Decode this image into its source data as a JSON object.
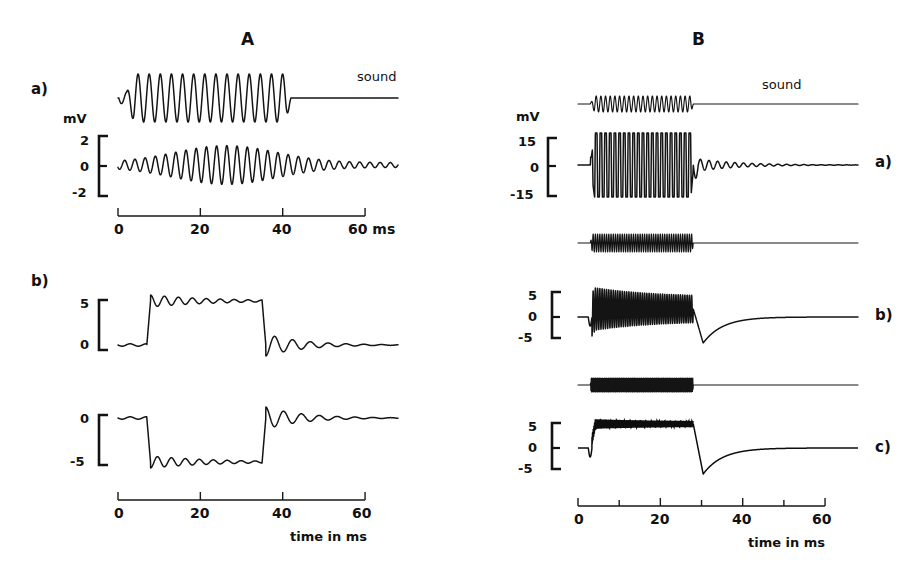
{
  "figure": {
    "background": "#ffffff",
    "ink": "#141414",
    "width": 924,
    "height": 570
  },
  "panels": [
    {
      "id": "A",
      "title": "A",
      "axis": {
        "title": "time in ms",
        "unit_label": "mV",
        "ticks_major": [
          0,
          20,
          40,
          60
        ],
        "tick_labels": [
          "0",
          "20",
          "40",
          "60"
        ],
        "minor_step": null,
        "range_ms": [
          0,
          68
        ]
      },
      "rows": [
        {
          "part": "a)",
          "sound_label": "sound",
          "scale": {
            "top": "2",
            "mid": "0",
            "bottom": "-2",
            "unit": "mV"
          },
          "axis_suffix": "60 ms"
        },
        {
          "part": "b)",
          "sound_label": "",
          "scales": [
            {
              "top": "5",
              "bottom": "0"
            },
            {
              "top": "0",
              "bottom": "-5"
            }
          ]
        }
      ]
    },
    {
      "id": "B",
      "title": "B",
      "axis": {
        "title": "time in ms",
        "unit_label": "mV",
        "ticks_major": [
          0,
          20,
          40,
          60
        ],
        "tick_labels": [
          "0",
          "20",
          "40",
          "60"
        ],
        "minor_step": 10,
        "range_ms": [
          0,
          68
        ]
      },
      "rows": [
        {
          "part": "a)",
          "sound_label": "sound",
          "scale": {
            "top": "15",
            "mid": "0",
            "bottom": "-15"
          }
        },
        {
          "part": "b)",
          "sound_label": "",
          "scale": {
            "top": "5",
            "mid": "0",
            "bottom": "-5"
          }
        },
        {
          "part": "c)",
          "sound_label": "",
          "scale": {
            "top": "5",
            "mid": "0",
            "bottom": "-5"
          }
        }
      ]
    }
  ],
  "chart_data": {
    "type": "line",
    "xlabel": "time in ms",
    "ylabel": "mV",
    "panels": [
      {
        "panel": "A",
        "x0_px": 118,
        "x1_px": 398,
        "xlim_ms": [
          0,
          68
        ],
        "traces": [
          {
            "name": "A-a-sound",
            "kind": "stimulus",
            "label": "sound",
            "baseline_y": 98,
            "start_ms": 1.5,
            "stop_ms": 42,
            "cycles": 15,
            "amplitude_px": 24,
            "onset_dip_px": 7,
            "style": "sine-burst",
            "tail_flat": true
          },
          {
            "name": "A-a-response",
            "kind": "response",
            "baseline_y": 165,
            "start_ms": 1.0,
            "stop_ms": 68,
            "cycles": 27,
            "amplitude_px": 20,
            "envelope": "spindle",
            "style": "sine-envelope",
            "scale_values": [
              2,
              0,
              -2
            ],
            "scale_unit": "mV"
          },
          {
            "name": "A-b-response-upper",
            "kind": "response",
            "baseline_y": 345,
            "step_on_ms": 7,
            "step_off_ms": 35,
            "plateau_px": -44,
            "ripple_px": 6,
            "ripple_cycles": 8,
            "ring_px": 11,
            "ring_cycles": 7,
            "style": "square-ripple",
            "scale_values": [
              5,
              0
            ]
          },
          {
            "name": "A-b-response-lower",
            "kind": "response",
            "baseline_y": 418,
            "step_on_ms": 7,
            "step_off_ms": 35,
            "plateau_px": 44,
            "ripple_px": 6,
            "ripple_cycles": 8,
            "ring_px": 11,
            "ring_cycles": 7,
            "style": "square-ripple-inverted",
            "scale_values": [
              0,
              -5
            ]
          }
        ]
      },
      {
        "panel": "B",
        "x0_px": 578,
        "x1_px": 858,
        "xlim_ms": [
          0,
          68
        ],
        "traces": [
          {
            "name": "B-a-sound",
            "kind": "stimulus",
            "label": "sound",
            "baseline_y": 104,
            "start_ms": 3,
            "stop_ms": 28,
            "cycles": 22,
            "amplitude_px": 8,
            "style": "sine-burst",
            "tail_flat": true
          },
          {
            "name": "B-a-response",
            "kind": "response",
            "baseline_y": 165,
            "start_ms": 3,
            "stop_ms": 28,
            "cycles": 22,
            "amplitude_px": 32,
            "style": "square-sine-burst",
            "after_ring_px": 6,
            "after_ring_cycles": 16,
            "scale_values": [
              15,
              0,
              -15
            ],
            "scale_unit": "mV"
          },
          {
            "name": "B-b-sound",
            "kind": "stimulus",
            "baseline_y": 243,
            "start_ms": 3,
            "stop_ms": 28,
            "cycles": 46,
            "amplitude_px": 9,
            "style": "sine-burst",
            "tail_flat": true
          },
          {
            "name": "B-b-response",
            "kind": "response",
            "baseline_y": 317,
            "start_ms": 3,
            "stop_ms": 28,
            "cycles": 46,
            "amplitude_px": 22,
            "dc_offset_px": -8,
            "undershoot_px": 26,
            "recovery_ms": 38,
            "style": "burst-with-dc",
            "scale_values": [
              5,
              0,
              -5
            ]
          },
          {
            "name": "B-c-sound",
            "kind": "stimulus",
            "baseline_y": 385,
            "start_ms": 3,
            "stop_ms": 28,
            "cycles": 150,
            "amplitude_px": 7,
            "style": "sine-burst-dense",
            "tail_flat": true
          },
          {
            "name": "B-c-response",
            "kind": "response",
            "baseline_y": 448,
            "start_ms": 3,
            "stop_ms": 28,
            "cycles": 150,
            "amplitude_px": 5,
            "dc_offset_px": -24,
            "undershoot_px": 26,
            "recovery_ms": 38,
            "style": "burst-with-dc-dense",
            "scale_values": [
              5,
              0,
              -5
            ]
          }
        ]
      }
    ]
  }
}
